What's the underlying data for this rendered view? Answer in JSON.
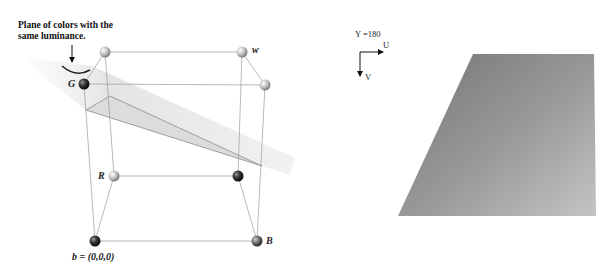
{
  "diagram": {
    "left_panel": {
      "annotation": "Plane of colors with the same luminance.",
      "annotation_line1": "Plane of colors with the",
      "annotation_line2": "same luminance.",
      "vertex_labels": {
        "white": "w",
        "green": "G",
        "red": "R",
        "blue": "B",
        "black": "b = (0,0,0)"
      },
      "title": "RGB color cube with constant-luminance plane"
    },
    "right_panel": {
      "y_value_label": "Y =180",
      "u_axis_label": "U",
      "v_axis_label": "V",
      "description": "Gray trapezoid showing UV slice at Y=180"
    },
    "colors": {
      "plane_fill": "#e6e6e6",
      "cube_edges": "#9a9a9a",
      "slice_gradient_dark": "#7a7a7a",
      "slice_gradient_light": "#c8c8c8"
    }
  }
}
